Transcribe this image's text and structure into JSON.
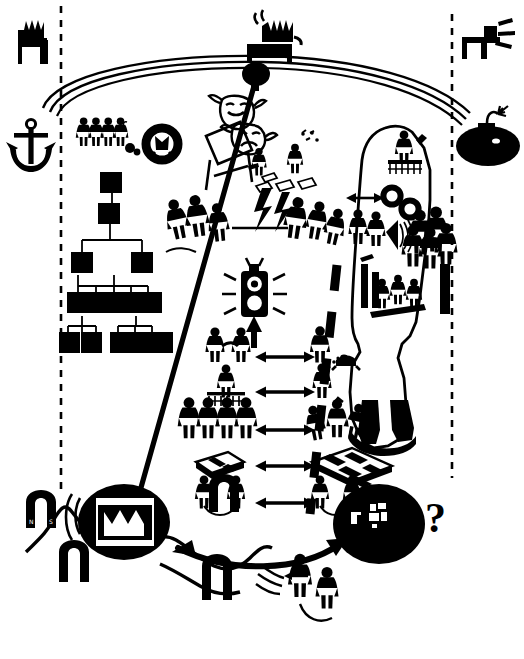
{
  "figure": {
    "style": "hand-drawn black-and-white clip-art illustration",
    "background_color": "#ffffff",
    "ink_color": "#000000",
    "width": 524,
    "height": 659
  },
  "annotations": {
    "question_mark": "?"
  },
  "icons": {
    "top_left_factory": "factory-icon",
    "top_center_factory": "factory-broadcast-icon",
    "top_right_antenna": "antenna-transmitter-icon",
    "anchor": "anchor-icon",
    "life_ring": "life-ring-icon",
    "bomb": "bomb-icon",
    "traffic_light": "traffic-light-icon",
    "theatre_masks": "theatre-masks-icon",
    "easel": "easel-icon",
    "org_chart": "org-chart-icon",
    "globe_left": "dark-globe-screen-icon",
    "globe_right": "dark-globe-unknown-icon",
    "magnet_north_south": "horseshoe-magnet-icon",
    "megaphone_waves": "sound-waves-icon"
  },
  "org_chart": {
    "levels": [
      1,
      1,
      2,
      5,
      5
    ],
    "node_fill": "#000000",
    "connector_color": "#000000"
  },
  "magnets": [
    {
      "label_left": "N",
      "label_right": "S"
    },
    {
      "label_left": "N",
      "label_right": "S"
    },
    {
      "label_left": "N",
      "label_right": "S"
    },
    {
      "label_left": "N",
      "label_right": "S"
    }
  ],
  "pair_rows": [
    {
      "left": "two-figures-shaking-hands",
      "right": "figure-standing-and-figure-kneeling"
    },
    {
      "left": "figure-on-podium-with-audience",
      "right": "figure-drinking"
    },
    {
      "left": "row-of-four-uniform-figures",
      "right": "group-of-celebrating-figures"
    },
    {
      "left": "small-office-floorplan",
      "right": "large-office-floorplan"
    },
    {
      "left": "two-figures-tied-with-rope",
      "right": "two-figures-tied-with-rope"
    }
  ],
  "dashed_boundaries": {
    "left_vertical": "organization-boundary-left",
    "right_vertical": "organization-boundary-right",
    "diagonal": "internal-divide-diagonal"
  },
  "arcs": {
    "top_arc": "environment-arc",
    "bottom_arc": "feedback-arrow"
  }
}
